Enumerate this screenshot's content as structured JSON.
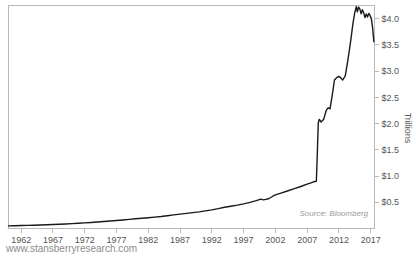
{
  "chart_data": {
    "type": "line",
    "title": "",
    "subtitle": "",
    "xlabel": "",
    "ylabel": "Trillions",
    "xlim": [
      1960.0,
      2017.6
    ],
    "ylim": [
      0.0,
      4.25
    ],
    "grid": false,
    "legend": false,
    "source_note": "Source: Bloomberg",
    "watermark": "www.stansberryresearch.com",
    "line_color": "#1a1a1a",
    "axis_color": "#b9b9b9",
    "label_color": "#555555",
    "background_color": "#ffffff",
    "xticks": [
      1962,
      1967,
      1972,
      1977,
      1982,
      1987,
      1992,
      1997,
      2002,
      2007,
      2012,
      2017
    ],
    "xtick_labels": [
      "1962",
      "1967",
      "1972",
      "1977",
      "1982",
      "1987",
      "1992",
      "1997",
      "2002",
      "2007",
      "2012",
      "2017"
    ],
    "yticks": [
      0.5,
      1.0,
      1.5,
      2.0,
      2.5,
      3.0,
      3.5,
      4.0
    ],
    "ytick_labels": [
      "$0.5",
      "$1.0",
      "$1.5",
      "$2.0",
      "$2.5",
      "$3.0",
      "$3.5",
      "$4.0"
    ],
    "series": [
      {
        "name": "Federal Reserve Balance Sheet",
        "x": [
          1960.0,
          1961.0,
          1962.0,
          1963.0,
          1964.0,
          1965.0,
          1966.0,
          1967.0,
          1968.0,
          1969.0,
          1970.0,
          1971.0,
          1972.0,
          1973.0,
          1974.0,
          1975.0,
          1976.0,
          1977.0,
          1978.0,
          1979.0,
          1980.0,
          1981.0,
          1982.0,
          1983.0,
          1984.0,
          1985.0,
          1986.0,
          1987.0,
          1988.0,
          1989.0,
          1990.0,
          1991.0,
          1992.0,
          1993.0,
          1994.0,
          1995.0,
          1996.0,
          1997.0,
          1998.0,
          1999.0,
          1999.7,
          2000.1,
          2000.5,
          2001.0,
          2001.6,
          2002.0,
          2003.0,
          2004.0,
          2005.0,
          2006.0,
          2007.0,
          2007.6,
          2008.0,
          2008.45,
          2008.62,
          2008.75,
          2008.9,
          2009.2,
          2009.6,
          2010.0,
          2010.3,
          2010.6,
          2011.0,
          2011.3,
          2011.6,
          2012.0,
          2012.3,
          2012.6,
          2013.0,
          2013.4,
          2013.8,
          2014.2,
          2014.5,
          2014.75,
          2014.9,
          2015.1,
          2015.3,
          2015.5,
          2015.7,
          2015.9,
          2016.1,
          2016.3,
          2016.5,
          2016.7,
          2016.9,
          2017.1,
          2017.3,
          2017.5
        ],
        "y": [
          0.05,
          0.053,
          0.056,
          0.059,
          0.063,
          0.067,
          0.071,
          0.076,
          0.081,
          0.086,
          0.092,
          0.099,
          0.107,
          0.115,
          0.124,
          0.133,
          0.142,
          0.152,
          0.163,
          0.174,
          0.186,
          0.196,
          0.205,
          0.216,
          0.228,
          0.243,
          0.26,
          0.275,
          0.289,
          0.302,
          0.317,
          0.335,
          0.355,
          0.378,
          0.404,
          0.425,
          0.446,
          0.47,
          0.497,
          0.53,
          0.56,
          0.545,
          0.555,
          0.572,
          0.615,
          0.64,
          0.68,
          0.72,
          0.76,
          0.8,
          0.845,
          0.87,
          0.89,
          0.9,
          1.5,
          2.01,
          2.08,
          2.03,
          2.08,
          2.25,
          2.3,
          2.28,
          2.58,
          2.83,
          2.87,
          2.9,
          2.87,
          2.83,
          2.91,
          3.2,
          3.53,
          3.9,
          4.12,
          4.23,
          4.13,
          4.22,
          4.18,
          4.09,
          4.17,
          4.11,
          4.02,
          4.09,
          4.03,
          4.1,
          4.06,
          4.0,
          3.83,
          3.56
        ]
      }
    ]
  }
}
